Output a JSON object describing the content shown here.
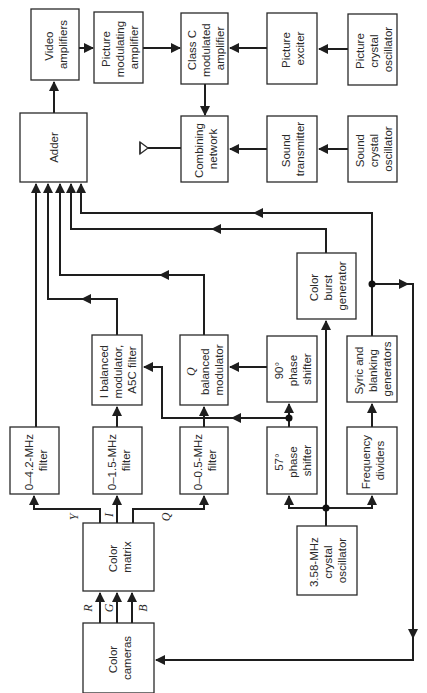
{
  "diagram": {
    "blocks": {
      "video_amplifiers": [
        "Video",
        "amplifiers"
      ],
      "picture_modulating_amplifier": [
        "Picture",
        "modulating",
        "amplifier"
      ],
      "class_c_modulated_amplifier": [
        "Class C",
        "modulated",
        "amplifier"
      ],
      "picture_exciter": [
        "Picture",
        "exciter"
      ],
      "picture_crystal_oscillator": [
        "Picture",
        "crystal",
        "oscillator"
      ],
      "adder": [
        "Adder"
      ],
      "combining_network": [
        "Combining",
        "network"
      ],
      "sound_transmitter": [
        "Sound",
        "transmitter"
      ],
      "sound_crystal_oscillator": [
        "Sound",
        "crystal",
        "oscillator"
      ],
      "color_burst_generator": [
        "Color",
        "burst",
        "generator"
      ],
      "i_balanced_modulator": [
        "I balanced",
        "modulator,",
        "A5C filter"
      ],
      "q_balanced_modulator": [
        "Q",
        "balanced",
        "modulator"
      ],
      "phase_shifter_90": [
        "90°",
        "phase",
        "shifter"
      ],
      "sync_blanking_generators": [
        "Syric and",
        "blanking",
        "generators"
      ],
      "filter_4_2": [
        "0–4.2-MHz",
        "filter"
      ],
      "filter_1_5": [
        "0–1.5-MHz",
        "filter"
      ],
      "filter_0_5": [
        "0–0.5-MHz",
        "filter"
      ],
      "phase_shifter_57": [
        "57°",
        "phase",
        "shifter"
      ],
      "frequency_dividers": [
        "Frequency",
        "dividers"
      ],
      "color_matrix": [
        "Color",
        "matrix"
      ],
      "crystal_oscillator_358": [
        "3.58-MHz",
        "crystal",
        "oscillator"
      ],
      "color_cameras": [
        "Color",
        "cameras"
      ]
    },
    "signals": {
      "y": "Y",
      "i": "I",
      "q": "Q",
      "r": "R",
      "g": "G",
      "b": "B"
    },
    "colors": {
      "line": "#1e1e1e",
      "box_border": "#2a2a2a",
      "background": "#ffffff"
    }
  }
}
